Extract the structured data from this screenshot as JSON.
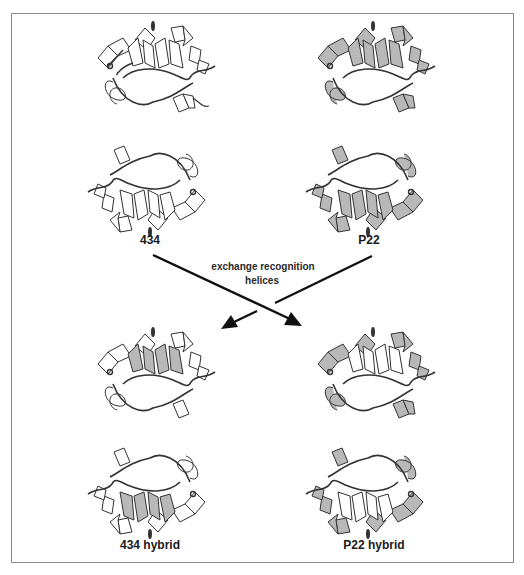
{
  "figure": {
    "panels": [
      {
        "id": "434",
        "label": "434",
        "position": "top-left",
        "helix_fill": "white",
        "recognition_helix_fill": "white"
      },
      {
        "id": "P22",
        "label": "P22",
        "position": "top-right",
        "helix_fill": "gray",
        "recognition_helix_fill": "gray"
      },
      {
        "id": "434-hybrid",
        "label": "434 hybrid",
        "position": "bottom-left",
        "helix_fill": "white",
        "recognition_helix_fill": "gray"
      },
      {
        "id": "P22-hybrid",
        "label": "P22 hybrid",
        "position": "bottom-right",
        "helix_fill": "gray",
        "recognition_helix_fill": "white"
      }
    ],
    "arrow_caption": {
      "line1": "exchange  recognition",
      "line2": "helices"
    },
    "colors": {
      "frame": "#8a8a8a",
      "helix_gray": "#b8b8b8",
      "helix_white": "#ffffff",
      "stroke": "#333333",
      "text": "#1a1a1a"
    }
  }
}
